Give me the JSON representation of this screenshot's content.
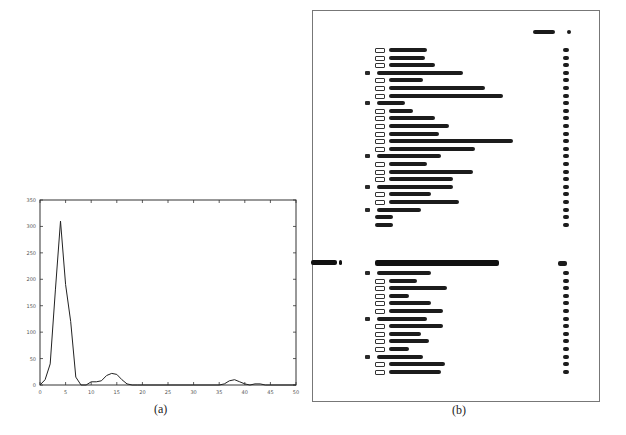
{
  "figure": {
    "caption_a": "(a)",
    "caption_b": "(b)"
  },
  "chart_data": {
    "type": "line",
    "title": "",
    "xlabel": "",
    "ylabel": "",
    "xlim": [
      0,
      50
    ],
    "ylim": [
      0,
      350
    ],
    "x_ticks": [
      0,
      5,
      10,
      15,
      20,
      25,
      30,
      35,
      40,
      45,
      50
    ],
    "y_ticks": [
      0,
      50,
      100,
      150,
      200,
      250,
      300,
      350
    ],
    "grid": false,
    "legend": null,
    "series": [
      {
        "name": "histogram",
        "x": [
          0,
          1,
          2,
          3,
          4,
          5,
          6,
          7,
          8,
          9,
          10,
          11,
          12,
          13,
          14,
          15,
          16,
          17,
          18,
          19,
          20,
          25,
          30,
          35,
          36,
          37,
          38,
          39,
          40,
          41,
          42,
          43,
          44,
          45,
          50
        ],
        "values": [
          0,
          10,
          40,
          180,
          310,
          190,
          120,
          15,
          0,
          0,
          6,
          6,
          8,
          18,
          22,
          20,
          10,
          2,
          0,
          0,
          0,
          0,
          0,
          0,
          2,
          8,
          10,
          6,
          2,
          0,
          2,
          2,
          0,
          0,
          0
        ]
      }
    ]
  },
  "toc": {
    "header_label": "Contents",
    "header_page": "p",
    "sections": [
      {
        "level": 2,
        "num_w": 10,
        "title_w": 38,
        "page": "xx"
      },
      {
        "level": 2,
        "num_w": 10,
        "title_w": 36,
        "page": "xx"
      },
      {
        "level": 2,
        "num_w": 10,
        "title_w": 46,
        "page": "xx"
      },
      {
        "level": 1,
        "num_w": 6,
        "title_w": 86,
        "page": "xx"
      },
      {
        "level": 2,
        "num_w": 10,
        "title_w": 34,
        "page": "xx"
      },
      {
        "level": 2,
        "num_w": 10,
        "title_w": 96,
        "page": "xx"
      },
      {
        "level": 2,
        "num_w": 10,
        "title_w": 114,
        "page": "xx"
      },
      {
        "level": 1,
        "num_w": 6,
        "title_w": 28,
        "page": "xx"
      },
      {
        "level": 2,
        "num_w": 10,
        "title_w": 24,
        "page": "xx"
      },
      {
        "level": 2,
        "num_w": 10,
        "title_w": 46,
        "page": "xx"
      },
      {
        "level": 2,
        "num_w": 10,
        "title_w": 60,
        "page": "xx"
      },
      {
        "level": 2,
        "num_w": 10,
        "title_w": 50,
        "page": "xx"
      },
      {
        "level": 2,
        "num_w": 10,
        "title_w": 124,
        "page": "xx"
      },
      {
        "level": 2,
        "num_w": 10,
        "title_w": 86,
        "page": "xx"
      },
      {
        "level": 1,
        "num_w": 6,
        "title_w": 64,
        "page": "xx"
      },
      {
        "level": 2,
        "num_w": 10,
        "title_w": 38,
        "page": "xx"
      },
      {
        "level": 2,
        "num_w": 10,
        "title_w": 84,
        "page": "xx"
      },
      {
        "level": 2,
        "num_w": 10,
        "title_w": 64,
        "page": "xx"
      },
      {
        "level": 1,
        "num_w": 6,
        "title_w": 76,
        "page": "xx"
      },
      {
        "level": 2,
        "num_w": 10,
        "title_w": 42,
        "page": "xx"
      },
      {
        "level": 2,
        "num_w": 10,
        "title_w": 70,
        "page": "xx"
      },
      {
        "level": 1,
        "num_w": 6,
        "title_w": 44,
        "page": "xx"
      },
      {
        "level": 3,
        "num_w": 0,
        "title_w": 18,
        "page": "xx"
      },
      {
        "level": 3,
        "num_w": 0,
        "title_w": 18,
        "page": "xx"
      }
    ],
    "chapter": {
      "label": "Chapter 3",
      "title_w": 124,
      "page": "xx"
    },
    "chapter_sections": [
      {
        "level": 1,
        "num_w": 6,
        "title_w": 54,
        "page": "xx"
      },
      {
        "level": 2,
        "num_w": 10,
        "title_w": 28,
        "page": "xx"
      },
      {
        "level": 2,
        "num_w": 10,
        "title_w": 58,
        "page": "xx"
      },
      {
        "level": 2,
        "num_w": 10,
        "title_w": 20,
        "page": "xx"
      },
      {
        "level": 2,
        "num_w": 10,
        "title_w": 42,
        "page": "xx"
      },
      {
        "level": 2,
        "num_w": 10,
        "title_w": 54,
        "page": "xx"
      },
      {
        "level": 1,
        "num_w": 6,
        "title_w": 50,
        "page": "xx"
      },
      {
        "level": 2,
        "num_w": 10,
        "title_w": 54,
        "page": "xx"
      },
      {
        "level": 2,
        "num_w": 10,
        "title_w": 32,
        "page": "xx"
      },
      {
        "level": 2,
        "num_w": 10,
        "title_w": 40,
        "page": "xx"
      },
      {
        "level": 2,
        "num_w": 10,
        "title_w": 20,
        "page": "xx"
      },
      {
        "level": 1,
        "num_w": 6,
        "title_w": 46,
        "page": "xx"
      },
      {
        "level": 2,
        "num_w": 10,
        "title_w": 56,
        "page": "xx"
      },
      {
        "level": 2,
        "num_w": 10,
        "title_w": 52,
        "page": "xx"
      }
    ]
  }
}
